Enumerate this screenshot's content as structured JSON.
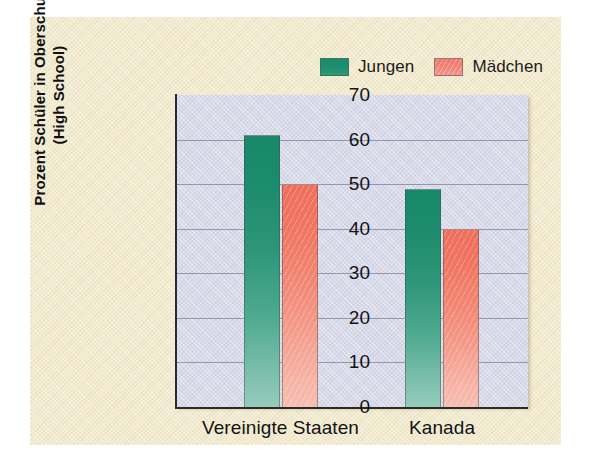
{
  "figure": {
    "panel_color": "#f3ecd1",
    "plot_background": "#d9dae9"
  },
  "legend": {
    "position": "top-center",
    "entries": [
      {
        "label": "Jungen",
        "color": "#1f9070",
        "swatch": "legend-swatch-boys"
      },
      {
        "label": "Mädchen",
        "color": "#f18478",
        "swatch": "legend-swatch-girls"
      }
    ]
  },
  "axes": {
    "y_title_line1": "Prozent Schüler in Oberschule",
    "y_title_line2": "(High School)",
    "y_ticks": [
      "70",
      "60",
      "50",
      "40",
      "30",
      "20",
      "10",
      "0"
    ],
    "x_labels": [
      "Vereinigte Staaten",
      "Kanada"
    ]
  },
  "chart_data": {
    "type": "bar",
    "title": "",
    "subtitle": "",
    "xlabel": "",
    "ylabel": "Prozent Schüler in Oberschule (High School)",
    "categories": [
      "Vereinigte Staaten",
      "Kanada"
    ],
    "series": [
      {
        "name": "Jungen",
        "color": "#1f9070",
        "values": [
          61,
          49
        ]
      },
      {
        "name": "Mädchen",
        "color": "#f18478",
        "values": [
          50,
          40
        ]
      }
    ],
    "ylim": [
      0,
      70
    ],
    "ytick_step": 10,
    "yticks": [
      0,
      10,
      20,
      30,
      40,
      50,
      60,
      70
    ],
    "grid": true,
    "grid_axis": "y",
    "legend_position": "top-center",
    "bar_gradient": true
  }
}
